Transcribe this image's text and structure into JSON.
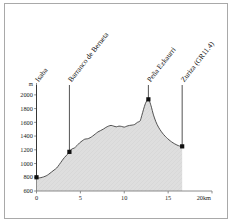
{
  "figure": {
    "background_color": "#ffffff",
    "frame_color": "#a9a9a9"
  },
  "chart_data": {
    "type": "area",
    "title": "",
    "subtitle": "",
    "xlabel": "",
    "ylabel": "",
    "x_unit": "20km",
    "y_unit": "m",
    "xlim": [
      0,
      20
    ],
    "ylim": [
      600,
      2100
    ],
    "x_ticks": [
      0,
      5,
      10,
      15,
      20
    ],
    "x_tick_labels": [
      "0",
      "5",
      "10",
      "15",
      "20km"
    ],
    "y_ticks": [
      600,
      800,
      1000,
      1200,
      1400,
      1600,
      1800,
      2000
    ],
    "y_tick_labels": [
      "600",
      "800",
      "1000",
      "1200",
      "1400",
      "1600",
      "1800",
      "2000"
    ],
    "grid": false,
    "legend": false,
    "legend_position": "none",
    "area_fill_color": "#dcdcdc",
    "line_color": "#404040",
    "marker_color": "#101010",
    "series": [
      {
        "name": "elevation-profile",
        "x": [
          0.0,
          0.25,
          0.5,
          0.8,
          1.1,
          1.4,
          1.7,
          2.0,
          2.3,
          2.6,
          2.9,
          3.2,
          3.5,
          3.75,
          4.0,
          4.3,
          4.6,
          4.9,
          5.2,
          5.5,
          5.8,
          6.1,
          6.4,
          6.7,
          7.0,
          7.3,
          7.6,
          7.9,
          8.2,
          8.5,
          8.8,
          9.1,
          9.4,
          9.7,
          10.0,
          10.3,
          10.6,
          10.9,
          11.2,
          11.5,
          11.8,
          12.0,
          12.2,
          12.4,
          12.6,
          12.75,
          12.9,
          13.1,
          13.3,
          13.6,
          13.9,
          14.2,
          14.5,
          14.8,
          15.1,
          15.4,
          15.7,
          16.0,
          16.3,
          16.6
        ],
        "y": [
          800,
          790,
          795,
          805,
          820,
          845,
          875,
          905,
          935,
          985,
          1040,
          1090,
          1130,
          1170,
          1210,
          1225,
          1260,
          1300,
          1330,
          1355,
          1360,
          1375,
          1400,
          1430,
          1460,
          1480,
          1500,
          1525,
          1545,
          1555,
          1545,
          1535,
          1545,
          1540,
          1530,
          1545,
          1555,
          1560,
          1570,
          1600,
          1620,
          1700,
          1790,
          1870,
          1920,
          1935,
          1900,
          1820,
          1720,
          1610,
          1530,
          1470,
          1420,
          1380,
          1345,
          1315,
          1290,
          1270,
          1255,
          1250
        ]
      }
    ],
    "points_of_interest": [
      {
        "label": "Isaba",
        "x": 0.0,
        "y": 800
      },
      {
        "label": "Barranco de Berueta",
        "x": 3.75,
        "y": 1170
      },
      {
        "label": "Peña Ezkaurri",
        "x": 12.75,
        "y": 1935
      },
      {
        "label": "Zuriza (GR11.4)",
        "x": 16.6,
        "y": 1250
      }
    ]
  }
}
